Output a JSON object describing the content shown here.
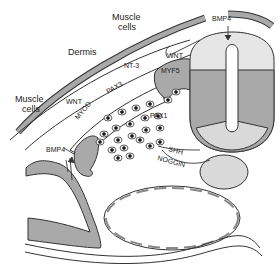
{
  "figure": {
    "labels": {
      "muscle_cells_top": [
        "Muscle",
        "cells"
      ],
      "muscle_cells_left": [
        "Muscle",
        "cells"
      ],
      "dermis": "Dermis",
      "nt3": "NT-3",
      "wnt_top": "WNT",
      "wnt_left": "WNT",
      "myf5": "MYF5",
      "pax3": "PAX3",
      "myod": "MYOD",
      "pax1": "PAX1",
      "bmp4_top": "BMP4",
      "bmp4_left": "BMP4",
      "shh": "SHH",
      "noggin": "NOGGIN"
    },
    "colors": {
      "dark_fill": "#a9a9a9",
      "light_fill": "#d9d9d9",
      "stroke": "#333333",
      "background": "#ffffff"
    }
  }
}
